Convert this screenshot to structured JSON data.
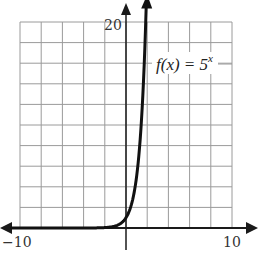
{
  "chart_data": {
    "type": "line",
    "title": "",
    "xlabel": "",
    "ylabel": "",
    "xlim": [
      -10,
      10
    ],
    "ylim": [
      0,
      20
    ],
    "grid": true,
    "grid_step_x": 2,
    "grid_step_y": 2,
    "tick_labels": {
      "x_min": "−10",
      "x_max": "10",
      "y_max": "20"
    },
    "series": [
      {
        "name": "f(x) = 5^x",
        "function": "5^x",
        "x": [
          -10,
          -8,
          -6,
          -4,
          -3,
          -2,
          -1.5,
          -1,
          -0.5,
          0,
          0.5,
          1,
          1.5,
          1.86
        ],
        "values": [
          0,
          0,
          0,
          0.0016,
          0.008,
          0.04,
          0.089,
          0.2,
          0.447,
          1,
          2.236,
          5,
          11.18,
          20
        ]
      }
    ],
    "annotations": [
      {
        "text": "f(x) = 5",
        "superscript": "x",
        "position": "upper right of curve"
      }
    ],
    "legend": "none"
  },
  "labels": {
    "x_min": "−10",
    "x_max": "10",
    "y_max": "20",
    "func_prefix": "f(x) = 5",
    "func_exp": "x"
  },
  "colors": {
    "grid": "#9a9a9a",
    "axis": "#1a1a1a",
    "curve": "#111111",
    "background": "#ffffff"
  }
}
